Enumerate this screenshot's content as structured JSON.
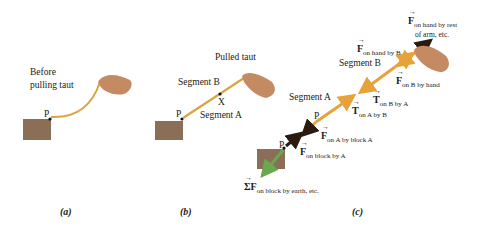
{
  "panels": {
    "a": {
      "caption": "(a)",
      "text_line1": "Before",
      "text_line2": "pulling taut",
      "point_label": "P"
    },
    "b": {
      "caption": "(b)",
      "title": "Pulled taut",
      "segment_b": "Segment B",
      "segment_a": "Segment A",
      "point_x": "X",
      "point_label": "P"
    },
    "c": {
      "caption": "(c)",
      "segment_b": "Segment B",
      "segment_a": "Segment A",
      "point_label_upper": "P",
      "point_label_lower": "P",
      "forces": {
        "f_hand_by_arm": {
          "symbol": "F",
          "sub": "on hand by rest",
          "sub2": "of arm, etc."
        },
        "f_hand_by_b": {
          "symbol": "F",
          "sub": "on hand by B"
        },
        "f_b_by_hand": {
          "symbol": "F",
          "sub": "on B by hand"
        },
        "t_b_by_a": {
          "symbol": "T",
          "sub": "on B by A"
        },
        "t_a_by_b": {
          "symbol": "T",
          "sub": "on A by B"
        },
        "f_a_by_block": {
          "symbol": "F",
          "sub": "on A by block A"
        },
        "f_block_by_a": {
          "symbol": "F",
          "sub": "on block by A"
        },
        "sum_f_block_by_earth": {
          "symbol": "ΣF",
          "sub": "on block by earth, etc."
        }
      }
    }
  },
  "colors": {
    "block": "#8a6e55",
    "rope": "#d9a441",
    "arrow_orange": "#e8a23a",
    "arrow_dark": "#2b1a0e",
    "arrow_green": "#6aa84f",
    "hand": "#c48a62"
  }
}
